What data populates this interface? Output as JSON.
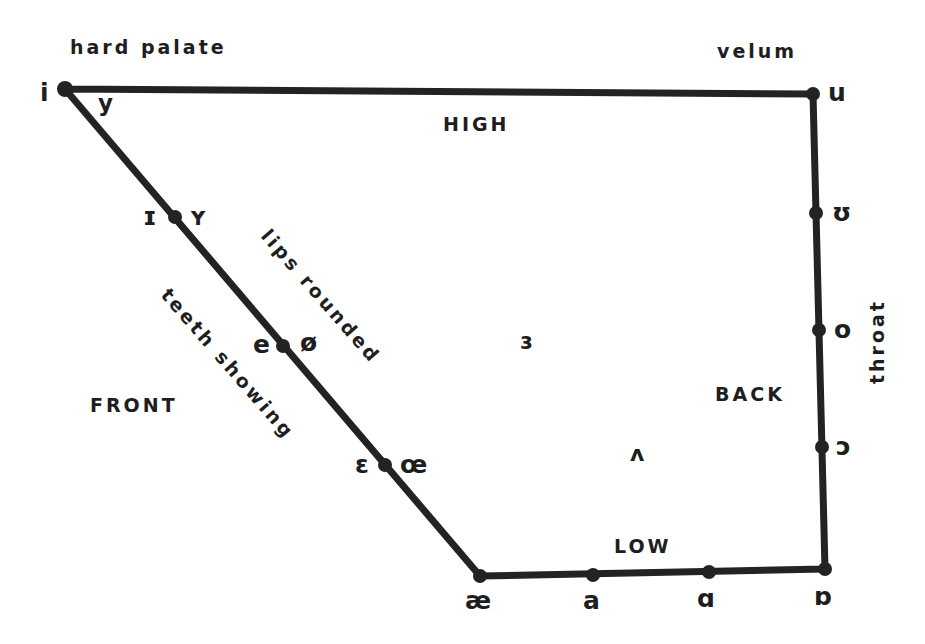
{
  "diagram": {
    "line_color": "#232323",
    "background": "#ffffff",
    "outline": [
      [
        65,
        89
      ],
      [
        813,
        94
      ],
      [
        825,
        569
      ],
      [
        480,
        576
      ],
      [
        65,
        89
      ]
    ],
    "anatomy_labels": {
      "hard_palate": "hard palate",
      "velum": "velum",
      "throat": "throat",
      "lips_rounded": "lips rounded",
      "teeth_showing": "teeth showing"
    },
    "region_labels": {
      "high": "HIGH",
      "low": "LOW",
      "front": "FRONT",
      "back": "BACK"
    },
    "points": [
      {
        "id": "i",
        "x": 65,
        "y": 89,
        "left": "i",
        "right": "y"
      },
      {
        "id": "I",
        "x": 175,
        "y": 217,
        "left": "ɪ",
        "right": "ʏ"
      },
      {
        "id": "e",
        "x": 283,
        "y": 346,
        "left": "e",
        "right": "ø"
      },
      {
        "id": "E",
        "x": 385,
        "y": 465,
        "left": "ɛ",
        "right": "œ"
      },
      {
        "id": "ae",
        "x": 480,
        "y": 576,
        "below": "æ"
      },
      {
        "id": "a",
        "x": 593,
        "y": 575,
        "below": "a"
      },
      {
        "id": "A",
        "x": 709,
        "y": 572,
        "below": "ɑ"
      },
      {
        "id": "O2",
        "x": 825,
        "y": 569,
        "below": "ɒ"
      },
      {
        "id": "u",
        "x": 813,
        "y": 94,
        "right": "u"
      },
      {
        "id": "U",
        "x": 816,
        "y": 213,
        "right": "ʊ"
      },
      {
        "id": "o",
        "x": 819,
        "y": 330,
        "right": "o"
      },
      {
        "id": "O",
        "x": 822,
        "y": 447,
        "right": "ɔ"
      }
    ],
    "unplotted_vowels": {
      "schwa_r": "ɜ",
      "wedge": "ʌ"
    }
  }
}
